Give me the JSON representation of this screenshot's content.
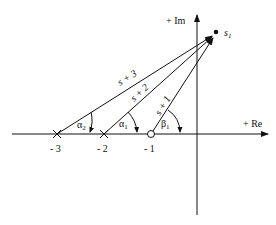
{
  "diagram": {
    "type": "s-plane vector diagram",
    "axes": {
      "imag_label": "+ Im",
      "real_label": "+ Re"
    },
    "point": {
      "label": "s",
      "subscript": "1"
    },
    "poles": [
      {
        "value": "- 3",
        "marker": "x"
      },
      {
        "value": "- 2",
        "marker": "x"
      }
    ],
    "zeros": [
      {
        "value": "- 1",
        "marker": "o"
      }
    ],
    "vectors": [
      {
        "label": "s + 3",
        "from": "- 3"
      },
      {
        "label": "s + 2",
        "from": "- 2"
      },
      {
        "label": "s + 1",
        "from": "- 1"
      }
    ],
    "angles": [
      {
        "symbol": "α",
        "subscript": "2",
        "at": "- 3"
      },
      {
        "symbol": "α",
        "subscript": "1",
        "at": "- 2"
      },
      {
        "symbol": "β",
        "subscript": "1",
        "at": "- 1"
      }
    ]
  }
}
